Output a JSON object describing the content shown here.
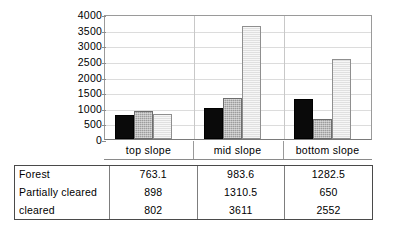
{
  "chart_data": {
    "type": "bar",
    "title": "",
    "subtitle": "",
    "xlabel": "",
    "ylabel": "",
    "categories": [
      "top slope",
      "mid slope",
      "bottom slope"
    ],
    "series": [
      {
        "name": "Forest",
        "values": [
          763.1,
          983.6,
          1282.5
        ]
      },
      {
        "name": "Partially cleared",
        "values": [
          898,
          1310.5,
          650
        ]
      },
      {
        "name": "cleared",
        "values": [
          802,
          3611,
          2552
        ]
      }
    ],
    "ylim": [
      0,
      4000
    ],
    "ytick_labels": [
      "4000",
      "3500",
      "3000",
      "2500",
      "2000",
      "1500",
      "1000",
      "500",
      "0"
    ],
    "ytick_values": [
      4000,
      3500,
      3000,
      2500,
      2000,
      1500,
      1000,
      500,
      0
    ],
    "grid": true,
    "legend": "none",
    "series_styles": [
      "solid-black",
      "hatched-gray",
      "light-gray"
    ],
    "colors": {
      "series0": "#0a0a0a",
      "series1": "#9d9d9d",
      "series2": "#e7e7e7",
      "gridline": "#dcdcdc",
      "axis": "#8a8a8a",
      "table_border": "#4a4a4a",
      "text": "#000000"
    }
  },
  "table": {
    "column_headers": [
      "",
      "top slope",
      "mid slope",
      "bottom slope"
    ],
    "rows": [
      {
        "label": "Forest",
        "values": [
          "763.1",
          "983.6",
          "1282.5"
        ]
      },
      {
        "label": "Partially cleared",
        "values": [
          "898",
          "1310.5",
          "650"
        ]
      },
      {
        "label": "cleared",
        "values": [
          "802",
          "3611",
          "2552"
        ]
      }
    ]
  }
}
